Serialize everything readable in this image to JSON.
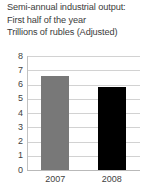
{
  "title": {
    "line1": "Semi-annual industrial output:",
    "line2": "First half of the year",
    "line3": "Trillions of rubles (Adjusted)"
  },
  "chart_data": {
    "type": "bar",
    "title": "Semi-annual industrial output: First half of the year Trillions of rubles (Adjusted)",
    "xlabel": "",
    "ylabel": "",
    "categories": [
      "2007",
      "2008"
    ],
    "values": [
      6.6,
      5.8
    ],
    "series": [
      {
        "name": "Industrial output",
        "values": [
          6.6,
          5.8
        ],
        "colors": [
          "#787878",
          "#000000"
        ]
      }
    ],
    "ylim": [
      0,
      8
    ],
    "yticks": [
      8,
      7,
      6,
      5,
      4,
      3,
      2,
      1,
      0
    ],
    "ytick_labels": [
      "8",
      "7",
      "6",
      "5",
      "4",
      "3",
      "2",
      "1",
      "0"
    ],
    "grid": true,
    "grid_axis": "y",
    "legend": false,
    "legend_position": "none"
  },
  "colors": {
    "bar_2007": "#787878",
    "bar_2008": "#000000",
    "gridline": "#d2d2d2",
    "axis": "#c2c2c2",
    "text": "#3b3b3b",
    "background": "#ffffff"
  }
}
